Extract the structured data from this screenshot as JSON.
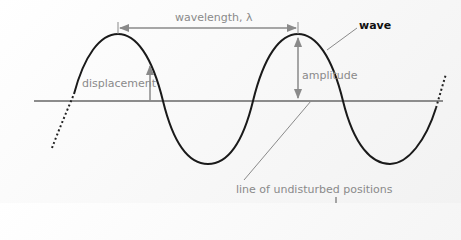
{
  "diagram": {
    "labels": {
      "wavelength": "wavelength, λ",
      "wave": "wave",
      "displacement": "displacement",
      "amplitude": "amplitude",
      "equilibrium": "line of undisturbed positions"
    },
    "colors": {
      "wave": "#1a1a1a",
      "axis": "#8c8c8c",
      "annotation": "#8a8a8a",
      "background": "#f6f6f6"
    },
    "geometry": {
      "axis_y": 101,
      "crest_y": 34,
      "trough_y": 164,
      "crests_x": [
        118,
        298
      ],
      "troughs_x": [
        208,
        390
      ]
    }
  }
}
